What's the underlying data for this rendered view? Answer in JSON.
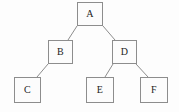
{
  "figure": {
    "type": "binary-tree-diagram",
    "width": 179,
    "height": 112,
    "background_color": "#fdfdfd",
    "node_border_color": "#8d8d8d",
    "node_fill_color": "#fcfcfc",
    "edge_color": "#8d8d8d",
    "label_color": "#1d1d1d"
  },
  "nodes": [
    {
      "id": "A",
      "label": "A",
      "x": 77,
      "y": 2,
      "width": 26,
      "height": 24,
      "level": 0
    },
    {
      "id": "B",
      "label": "B",
      "x": 48,
      "y": 40,
      "width": 25,
      "height": 24,
      "level": 1
    },
    {
      "id": "D",
      "label": "D",
      "x": 112,
      "y": 40,
      "width": 25,
      "height": 24,
      "level": 1
    },
    {
      "id": "C",
      "label": "C",
      "x": 14,
      "y": 77,
      "width": 27,
      "height": 26,
      "level": 2
    },
    {
      "id": "E",
      "label": "E",
      "x": 86,
      "y": 77,
      "width": 28,
      "height": 26,
      "level": 2
    },
    {
      "id": "F",
      "label": "F",
      "x": 140,
      "y": 77,
      "width": 28,
      "height": 26,
      "level": 2
    }
  ],
  "edges": [
    {
      "id": "A-B",
      "from": "A",
      "to": "B",
      "x1": 77,
      "y1": 26,
      "x2": 68,
      "y2": 40
    },
    {
      "id": "A-D",
      "from": "A",
      "to": "D",
      "x1": 103,
      "y1": 26,
      "x2": 115,
      "y2": 40
    },
    {
      "id": "B-C",
      "from": "B",
      "to": "C",
      "x1": 48,
      "y1": 64,
      "x2": 37,
      "y2": 77
    },
    {
      "id": "D-E",
      "from": "D",
      "to": "E",
      "x1": 113,
      "y1": 64,
      "x2": 105,
      "y2": 77
    },
    {
      "id": "D-F",
      "from": "D",
      "to": "F",
      "x1": 136,
      "y1": 64,
      "x2": 148,
      "y2": 77
    }
  ]
}
